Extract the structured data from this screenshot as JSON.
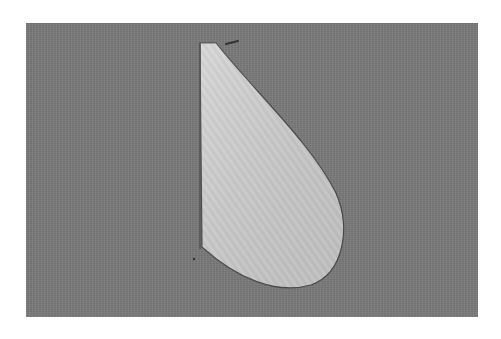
{
  "photo": {
    "subject": "pattern-piece-on-fabric",
    "background_color": "#7a7a7a",
    "piece_color": "#d2d2d2",
    "edge_color": "#4a4a4a"
  },
  "caption": {
    "text": ""
  }
}
